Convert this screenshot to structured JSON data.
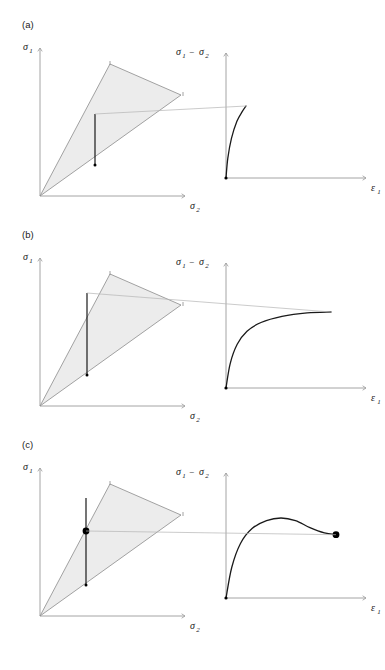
{
  "figure": {
    "title": "",
    "background_color": "#ffffff",
    "width": 385,
    "height": 670
  },
  "style": {
    "axis_color": "#9a9a9a",
    "curve_color": "#1a1a1a",
    "triangle_fill": "#ececec",
    "triangle_stroke": "#8c8c8c",
    "connector_color": "#b4b4b4",
    "marker_color": "#000000",
    "text_color": "#1a1a1a"
  },
  "labels": {
    "sigma1": "σ",
    "sigma1_sub": "1",
    "sigma2": "σ",
    "sigma2_sub": "2",
    "deviator_first": "σ",
    "deviator_first_sub": "1",
    "deviator_minus": "−",
    "deviator_second": "σ",
    "deviator_second_sub": "2",
    "epsilon1": "ε",
    "epsilon1_sub": "1"
  },
  "panels": [
    {
      "id": "a",
      "tag": "(a)",
      "behaviour": "brittle-elastic",
      "left_plot": {
        "name": "stress-space-plot",
        "y_axis_label": "sigma1",
        "x_axis_label": "sigma2",
        "region": {
          "name": "admissible-stress-region",
          "shape": "triangle",
          "vertices": [
            [
              0,
              0
            ],
            [
              70,
              132
            ],
            [
              141,
              101
            ]
          ]
        },
        "stress_path": {
          "name": "stress-path-segment",
          "start": [
            55,
            50
          ],
          "end": [
            55,
            101
          ],
          "top_marker": "none",
          "bottom_marker": "small-dot"
        }
      },
      "right_plot": {
        "name": "stress-strain-plot",
        "y_axis_label": "sigma1 - sigma2",
        "x_axis_label": "epsilon1",
        "curve": {
          "name": "stress-strain-curve",
          "type": "line",
          "description": "near-vertical elastic rise terminating abruptly with no yield plateau",
          "points": [
            [
              0,
              0
            ],
            [
              1,
              22
            ],
            [
              3,
              44
            ],
            [
              6,
              63
            ],
            [
              9,
              74
            ],
            [
              11,
              80
            ]
          ]
        },
        "end_marker": "none"
      },
      "connector": {
        "name": "level-connector-line",
        "description": "horizontal tie from stress-path top to curve peak"
      }
    },
    {
      "id": "b",
      "tag": "(b)",
      "behaviour": "strain-hardening-to-plateau",
      "left_plot": {
        "name": "stress-space-plot",
        "y_axis_label": "sigma1",
        "x_axis_label": "sigma2",
        "region": {
          "name": "admissible-stress-region",
          "shape": "triangle",
          "vertices": [
            [
              0,
              0
            ],
            [
              70,
              132
            ],
            [
              141,
              101
            ]
          ]
        },
        "stress_path": {
          "name": "stress-path-segment",
          "start": [
            47,
            19
          ],
          "end": [
            47,
            101
          ],
          "top_marker": "none",
          "bottom_marker": "small-dot"
        }
      },
      "right_plot": {
        "name": "stress-strain-plot",
        "y_axis_label": "sigma1 - sigma2",
        "x_axis_label": "epsilon1",
        "curve": {
          "name": "stress-strain-curve",
          "type": "line",
          "description": "concave hardening curve asymptotic to a horizontal plateau",
          "points": [
            [
              0,
              0
            ],
            [
              3,
              28
            ],
            [
              8,
              50
            ],
            [
              15,
              65
            ],
            [
              25,
              75
            ],
            [
              40,
              82
            ],
            [
              58,
              86
            ],
            [
              75,
              87
            ]
          ]
        },
        "end_marker": "none"
      },
      "connector": {
        "name": "level-connector-line",
        "description": "horizontal tie from stress-path top to curve plateau"
      }
    },
    {
      "id": "c",
      "tag": "(c)",
      "behaviour": "peak-then-strain-softening",
      "left_plot": {
        "name": "stress-space-plot",
        "y_axis_label": "sigma1",
        "x_axis_label": "sigma2",
        "region": {
          "name": "admissible-stress-region",
          "shape": "triangle",
          "vertices": [
            [
              0,
              0
            ],
            [
              70,
              132
            ],
            [
              141,
              101
            ]
          ]
        },
        "stress_path": {
          "name": "stress-path-segment",
          "start": [
            46,
            14
          ],
          "end": [
            46,
            101
          ],
          "top_marker": "none",
          "bottom_marker": "small-dot",
          "residual_point": [
            46,
            47
          ],
          "residual_marker": "large-filled-dot"
        }
      },
      "right_plot": {
        "name": "stress-strain-plot",
        "y_axis_label": "sigma1 - sigma2",
        "x_axis_label": "epsilon1",
        "curve": {
          "name": "stress-strain-curve",
          "type": "line",
          "description": "rises to a peak then softens to a residual plateau ending in a filled dot",
          "points": [
            [
              0,
              0
            ],
            [
              4,
              35
            ],
            [
              10,
              62
            ],
            [
              18,
              79
            ],
            [
              28,
              88
            ],
            [
              38,
              91
            ],
            [
              48,
              88
            ],
            [
              58,
              80
            ],
            [
              68,
              74
            ],
            [
              76,
              72
            ]
          ]
        },
        "end_marker": "large-filled-dot"
      },
      "connector": {
        "name": "level-connector-line",
        "description": "horizontal tie from residual point in stress space to curve end dot"
      }
    }
  ],
  "chart_data": {
    "type": "line",
    "title": "",
    "xlabel": "ε1",
    "ylabel": "σ1 − σ2",
    "grid": false,
    "legend": "none",
    "series": [
      {
        "name": "(a) brittle-elastic",
        "x": [
          0,
          1,
          3,
          6,
          9,
          11
        ],
        "y": [
          0,
          22,
          44,
          63,
          74,
          80
        ]
      },
      {
        "name": "(b) strain-hardening",
        "x": [
          0,
          3,
          8,
          15,
          25,
          40,
          58,
          75
        ],
        "y": [
          0,
          28,
          50,
          65,
          75,
          82,
          86,
          87
        ]
      },
      {
        "name": "(c) strain-softening",
        "x": [
          0,
          4,
          10,
          18,
          28,
          38,
          48,
          58,
          68,
          76
        ],
        "y": [
          0,
          35,
          62,
          79,
          88,
          91,
          88,
          80,
          74,
          72
        ]
      }
    ],
    "xlim": [
      0,
      100
    ],
    "ylim": [
      0,
      100
    ]
  }
}
